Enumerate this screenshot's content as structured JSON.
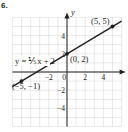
{
  "problem_number": "6.",
  "colors": {
    "grid": "#d9d9d9",
    "axis": "#231f20",
    "line": "#231f20",
    "text": "#231f20"
  },
  "chart_data": {
    "type": "line",
    "title": "",
    "xlabel": "x",
    "ylabel": "y",
    "xlim": [
      -6,
      6
    ],
    "ylim": [
      -6,
      6
    ],
    "grid": true,
    "x_ticks": [
      -2,
      0,
      2,
      4
    ],
    "x_tick_labels": [
      "−2",
      "0",
      "2",
      "4"
    ],
    "y_ticks": [
      4,
      2,
      -2,
      -4
    ],
    "y_tick_labels": [
      "4",
      "2",
      "−2",
      "−4"
    ],
    "series": [
      {
        "name": "y = 3/5 x + 2",
        "equation_label": "y = ⅕x + 2",
        "slope": 0.6,
        "intercept": 2,
        "x": [
          -6,
          6
        ],
        "y": [
          -1.6,
          5.6
        ]
      }
    ],
    "points": [
      {
        "x": 5,
        "y": 5,
        "label": "(5, 5)"
      },
      {
        "x": 0,
        "y": 2,
        "label": "(0, 2)"
      },
      {
        "x": -5,
        "y": -1,
        "label": "(−5, −1)"
      }
    ]
  }
}
